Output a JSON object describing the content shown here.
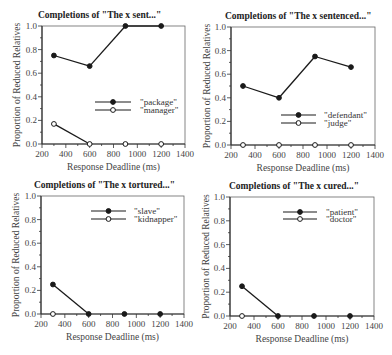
{
  "figure": {
    "background": "#ffffff",
    "line_color": "#1a1a1a",
    "axis_color": "#333333"
  },
  "chart_data": [
    {
      "type": "line",
      "title": "Completions of \"The x sent...\"",
      "xlabel": "Response Deadline (ms)",
      "ylabel": "Proportion of Reduced Relatives",
      "xlim": [
        200,
        1400
      ],
      "ylim": [
        0,
        1.0
      ],
      "xticks": [
        200,
        400,
        600,
        800,
        1000,
        1200,
        1400
      ],
      "yticks": [
        "0.0",
        "0.2",
        "0.4",
        "0.6",
        "0.8",
        "1.0"
      ],
      "grid": false,
      "legend_position": "center-right",
      "series": [
        {
          "name": "\"package\"",
          "marker": "filled",
          "x": [
            300,
            600,
            900,
            1200
          ],
          "values": [
            0.75,
            0.66,
            1.0,
            1.0
          ]
        },
        {
          "name": "\"manager\"",
          "marker": "open",
          "x": [
            300,
            600,
            900,
            1200
          ],
          "values": [
            0.17,
            0.0,
            0.0,
            0.0
          ],
          "connect": [
            [
              0,
              1
            ]
          ]
        }
      ]
    },
    {
      "type": "line",
      "title": "Completions of \"The x sentenced...\"",
      "xlabel": "Response Deadline (ms)",
      "ylabel": "Proportion of Reduced Relatives",
      "xlim": [
        200,
        1400
      ],
      "ylim": [
        0,
        1.0
      ],
      "xticks": [
        200,
        400,
        600,
        800,
        1000,
        1200,
        1400
      ],
      "yticks": [
        "0.0",
        "0.2",
        "0.4",
        "0.6",
        "0.8",
        "1.0"
      ],
      "grid": false,
      "legend_position": "lower-right",
      "series": [
        {
          "name": "\"defendant\"",
          "marker": "filled",
          "x": [
            300,
            600,
            900,
            1200
          ],
          "values": [
            0.5,
            0.4,
            0.75,
            0.66
          ]
        },
        {
          "name": "\"judge\"",
          "marker": "open",
          "x": [
            300,
            600,
            900,
            1200
          ],
          "values": [
            0.0,
            0.0,
            0.0,
            0.0
          ],
          "connect": []
        }
      ]
    },
    {
      "type": "line",
      "title": "Completions of \"The x tortured...\"",
      "xlabel": "Response Deadline (ms)",
      "ylabel": "Proportion of Reduced Relatives",
      "xlim": [
        200,
        1400
      ],
      "ylim": [
        0,
        1.0
      ],
      "xticks": [
        200,
        400,
        600,
        800,
        1000,
        1200,
        1400
      ],
      "yticks": [
        "0.0",
        "0.2",
        "0.4",
        "0.6",
        "0.8",
        "1.0"
      ],
      "grid": false,
      "legend_position": "upper-right",
      "series": [
        {
          "name": "\"slave\"",
          "marker": "filled",
          "x": [
            300,
            600,
            900,
            1200
          ],
          "values": [
            0.25,
            0.0,
            0.0,
            0.0
          ],
          "connect": [
            [
              0,
              1
            ]
          ]
        },
        {
          "name": "\"kidnapper\"",
          "marker": "open",
          "x": [
            300
          ],
          "values": [
            0.0
          ],
          "connect": []
        }
      ]
    },
    {
      "type": "line",
      "title": "Completions of \"The x cured...\"",
      "xlabel": "Response Deadline (ms)",
      "ylabel": "Proportion of Reduced Relatives",
      "xlim": [
        200,
        1400
      ],
      "ylim": [
        0,
        1.0
      ],
      "xticks": [
        200,
        400,
        600,
        800,
        1000,
        1200,
        1400
      ],
      "yticks": [
        "0.0",
        "0.2",
        "0.4",
        "0.6",
        "0.8",
        "1.0"
      ],
      "grid": false,
      "legend_position": "upper-right",
      "series": [
        {
          "name": "\"patient\"",
          "marker": "filled",
          "x": [
            300,
            600,
            900,
            1200
          ],
          "values": [
            0.25,
            0.0,
            0.0,
            0.0
          ],
          "connect": [
            [
              0,
              1
            ]
          ]
        },
        {
          "name": "\"doctor\"",
          "marker": "open",
          "x": [
            300
          ],
          "values": [
            0.0
          ],
          "connect": []
        }
      ]
    }
  ],
  "layout": [
    {
      "left": 42,
      "top": 26,
      "right": 185,
      "bottom": 144,
      "title_x": 38,
      "title_y": 18,
      "ylabel_x": 18,
      "legend": {
        "x1": 95,
        "x2": 131,
        "y1": 102,
        "y2": 110,
        "text_x": 140
      }
    },
    {
      "left": 231,
      "top": 27,
      "right": 375,
      "bottom": 145,
      "title_x": 225,
      "title_y": 19,
      "ylabel_x": 208,
      "legend": {
        "x1": 281,
        "x2": 316,
        "y1": 115,
        "y2": 123,
        "text_x": 324
      }
    },
    {
      "left": 41,
      "top": 196,
      "right": 184,
      "bottom": 314,
      "title_x": 34,
      "title_y": 188,
      "ylabel_x": 17,
      "legend": {
        "x1": 91,
        "x2": 126,
        "y1": 211,
        "y2": 219,
        "text_x": 134
      }
    },
    {
      "left": 230,
      "top": 197,
      "right": 374,
      "bottom": 316,
      "title_x": 229,
      "title_y": 189,
      "ylabel_x": 207,
      "legend": {
        "x1": 283,
        "x2": 317,
        "y1": 212,
        "y2": 219,
        "text_x": 326
      }
    }
  ]
}
